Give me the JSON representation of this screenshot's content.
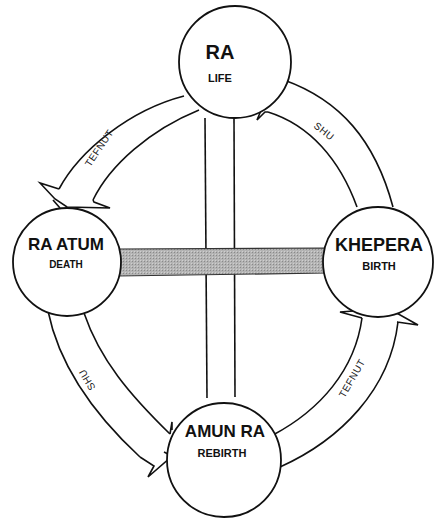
{
  "diagram": {
    "nodes": [
      {
        "id": "ra",
        "title": "RA",
        "subtitle": "LIFE",
        "position": "top"
      },
      {
        "id": "khepera",
        "title": "KHEPERA",
        "subtitle": "BIRTH",
        "position": "right"
      },
      {
        "id": "amun_ra",
        "title": "AMUN RA",
        "subtitle": "REBIRTH",
        "position": "bottom"
      },
      {
        "id": "ra_atum",
        "title": "RA ATUM",
        "subtitle": "DEATH",
        "position": "left"
      }
    ],
    "arrows": [
      {
        "label": "SHU",
        "from": "khepera",
        "to": "ra",
        "side": "upper-right"
      },
      {
        "label": "TEFNUT",
        "from": "ra",
        "to": "ra_atum",
        "side": "upper-left"
      },
      {
        "label": "SHU",
        "from": "ra_atum",
        "to": "amun_ra",
        "side": "lower-left"
      },
      {
        "label": "TEFNUT",
        "from": "amun_ra",
        "to": "khepera",
        "side": "lower-right"
      }
    ],
    "connectors": [
      {
        "type": "vertical-pillar",
        "from": "ra",
        "to": "amun_ra"
      },
      {
        "type": "horizontal-shaded-bar",
        "from": "ra_atum",
        "to": "khepera"
      }
    ],
    "colors": {
      "line": "#111111",
      "bar_fill": "#a8a8a8",
      "background": "#ffffff"
    }
  }
}
